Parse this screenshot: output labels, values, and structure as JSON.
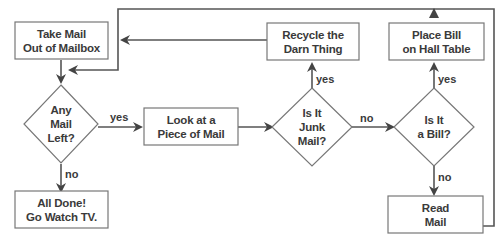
{
  "diagram": {
    "type": "flowchart",
    "colors": {
      "line": "#555555",
      "box_border": "#777777",
      "text": "#3a3a3a",
      "background": "#ffffff"
    },
    "nodes": {
      "take_mail": {
        "shape": "rectangle",
        "line1": "Take Mail",
        "line2": "Out of Mailbox"
      },
      "any_mail_left": {
        "shape": "diamond",
        "line1": "Any",
        "line2": "Mail",
        "line3": "Left?"
      },
      "all_done": {
        "shape": "rectangle",
        "line1": "All Done!",
        "line2": "Go Watch TV."
      },
      "look_at_mail": {
        "shape": "rectangle",
        "line1": "Look at a",
        "line2": "Piece of Mail"
      },
      "is_junk": {
        "shape": "diamond",
        "line1": "Is It",
        "line2": "Junk",
        "line3": "Mail?"
      },
      "recycle": {
        "shape": "rectangle",
        "line1": "Recycle the",
        "line2": "Darn Thing"
      },
      "is_bill": {
        "shape": "diamond",
        "line1": "Is It",
        "line2": "a Bill?"
      },
      "place_bill": {
        "shape": "rectangle",
        "line1": "Place Bill",
        "line2": "on Hall Table"
      },
      "read_mail": {
        "shape": "rectangle",
        "line1": "Read",
        "line2": "Mail"
      }
    },
    "edges": [
      {
        "from": "take_mail",
        "to": "any_mail_left",
        "label": ""
      },
      {
        "from": "any_mail_left",
        "to": "look_at_mail",
        "label": "yes"
      },
      {
        "from": "any_mail_left",
        "to": "all_done",
        "label": "no"
      },
      {
        "from": "look_at_mail",
        "to": "is_junk",
        "label": ""
      },
      {
        "from": "is_junk",
        "to": "recycle",
        "label": "yes"
      },
      {
        "from": "is_junk",
        "to": "is_bill",
        "label": "no"
      },
      {
        "from": "is_bill",
        "to": "place_bill",
        "label": "yes"
      },
      {
        "from": "is_bill",
        "to": "read_mail",
        "label": "no"
      },
      {
        "from": "recycle",
        "to": "take_mail",
        "label": ""
      },
      {
        "from": "place_bill",
        "to": "any_mail_left",
        "label": ""
      },
      {
        "from": "read_mail",
        "to": "place_bill",
        "label": ""
      }
    ],
    "edge_labels": {
      "any_yes": "yes",
      "any_no": "no",
      "junk_yes": "yes",
      "junk_no": "no",
      "bill_yes": "yes",
      "bill_no": "no"
    }
  }
}
